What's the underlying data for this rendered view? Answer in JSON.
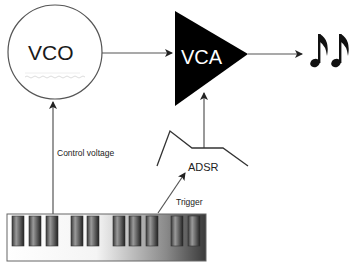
{
  "diagram": {
    "type": "synthesizer signal flow",
    "nodes": {
      "vco": {
        "label": "VCO",
        "shape": "circle"
      },
      "vca": {
        "label": "VCA",
        "shape": "triangle-amplifier"
      },
      "adsr": {
        "label": "ADSR",
        "shape": "envelope"
      },
      "keyboard": {
        "label": "",
        "shape": "keyboard"
      },
      "output": {
        "label": "",
        "icon": "music-notes-icon"
      }
    },
    "edges": [
      {
        "from": "vco",
        "to": "vca",
        "label": ""
      },
      {
        "from": "vca",
        "to": "output",
        "label": ""
      },
      {
        "from": "keyboard",
        "to": "vco",
        "label": "Control voltage"
      },
      {
        "from": "keyboard",
        "to": "adsr",
        "label": "Trigger"
      },
      {
        "from": "adsr",
        "to": "vca",
        "label": ""
      }
    ],
    "colors": {
      "line": "#555555",
      "vca_fill": "#000000",
      "vco_stroke": "#555555",
      "background": "#ffffff"
    }
  }
}
